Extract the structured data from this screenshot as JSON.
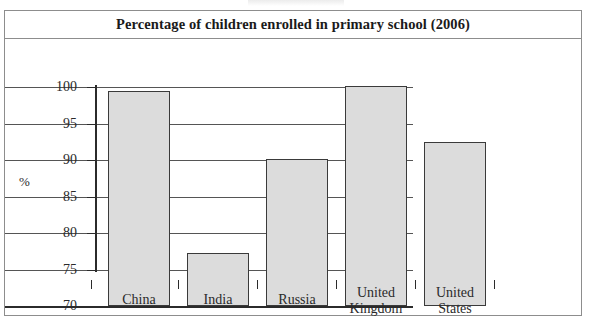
{
  "figure": {
    "title": "Percentage of children enrolled in primary school (2006)",
    "y_axis_title": "%"
  },
  "chart_data": {
    "type": "bar",
    "title": "Percentage of children enrolled in primary school (2006)",
    "xlabel": "",
    "ylabel": "%",
    "ylim": [
      70,
      100
    ],
    "yticks": [
      70,
      75,
      80,
      85,
      90,
      95,
      100
    ],
    "ytick_labels": [
      "70",
      "75",
      "80",
      "85",
      "90",
      "95",
      "100"
    ],
    "grid": true,
    "legend": null,
    "categories": [
      "China",
      "India",
      "Russia",
      "United Kingdom",
      "United States"
    ],
    "category_lines": [
      [
        "China"
      ],
      [
        "India"
      ],
      [
        "Russia"
      ],
      [
        "United",
        "Kingdom"
      ],
      [
        "United",
        "States"
      ]
    ],
    "values": [
      99.4,
      77.3,
      90.2,
      100.2,
      92.5
    ],
    "bar_color": "#dcdcdc",
    "bar_edge_color": "#3a3a3a"
  },
  "ticks": {
    "t0": "70",
    "t1": "75",
    "t2": "80",
    "t3": "85",
    "t4": "90",
    "t5": "95",
    "t6": "100"
  },
  "cats": {
    "c0_l0": "China",
    "c1_l0": "India",
    "c2_l0": "Russia",
    "c3_l0": "United",
    "c3_l1": "Kingdom",
    "c4_l0": "United",
    "c4_l1": "States"
  }
}
